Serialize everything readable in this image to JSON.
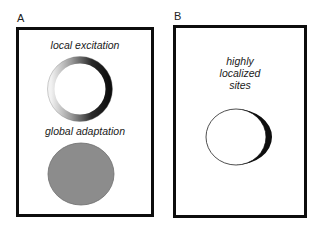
{
  "panels": [
    {
      "label": "A",
      "captions": [
        "local excitation",
        "global adaptation"
      ],
      "shapes": [
        {
          "type": "gradient-ring",
          "desc": "ring shaded light on left to dark on right"
        },
        {
          "type": "filled-disk",
          "color": "#8c8c8c"
        }
      ]
    },
    {
      "label": "B",
      "captions": [
        "highly",
        "localized",
        "sites"
      ],
      "shapes": [
        {
          "type": "crescent-circle",
          "desc": "thin circle outline with dark crescent on right"
        }
      ]
    }
  ],
  "colors": {
    "border": "#0d0d0d",
    "disk_fill": "#8c8c8c",
    "ring_dark": "#111111",
    "ring_light": "#f0f0f0"
  }
}
